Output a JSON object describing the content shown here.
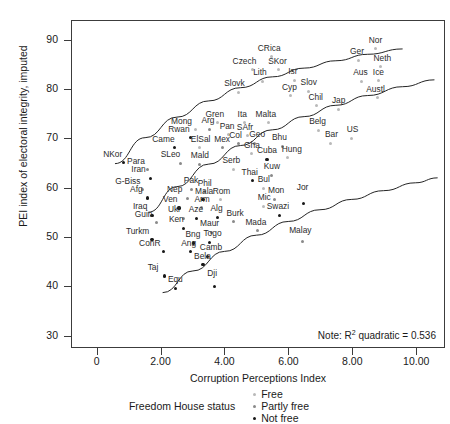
{
  "chart": {
    "type": "scatter",
    "title": "",
    "xlabel": "Corruption Perceptions Index",
    "ylabel": "PEI index of electoral integrity, imputed",
    "note": "Note: R",
    "note_sup": "2",
    "note_tail": " quadratic = 0.536",
    "xlim": [
      -0.8,
      10.9
    ],
    "ylim": [
      27.5,
      94.0
    ],
    "xticks": [
      "0",
      "2.00",
      "4.00",
      "6.00",
      "8.00",
      "10.00"
    ],
    "xtick_values": [
      0,
      2,
      4,
      6,
      8,
      10
    ],
    "yticks": [
      "30",
      "40",
      "50",
      "60",
      "70",
      "80",
      "90"
    ],
    "ytick_values": [
      30,
      40,
      50,
      60,
      70,
      80,
      90
    ],
    "grid": false,
    "legend_title": "Freedom House status",
    "legend": [
      {
        "label": "Free",
        "color": "#b9b9b9",
        "key": "free"
      },
      {
        "label": "Partly free",
        "color": "#8a8a8a",
        "key": "partly"
      },
      {
        "label": "Not free",
        "color": "#171717",
        "key": "notfree"
      }
    ]
  },
  "chart_data": {
    "type": "scatter",
    "title": "",
    "xlabel": "Corruption Perceptions Index",
    "ylabel": "PEI index of electoral integrity, imputed",
    "xlim": [
      -0.8,
      10.9
    ],
    "ylim": [
      27.5,
      94.0
    ],
    "annotation": "Note: R2 quadratic = 0.536",
    "r2_quadratic": 0.536,
    "legend_title": "Freedom House status",
    "series": [
      {
        "name": "Free",
        "color": "#b9b9b9"
      },
      {
        "name": "Partly free",
        "color": "#8a8a8a"
      },
      {
        "name": "Not free",
        "color": "#171717"
      }
    ],
    "fit_lines": [
      {
        "name": "upper-confidence-curve",
        "points": [
          [
            0.55,
            64.9
          ],
          [
            1.5,
            70.2
          ],
          [
            2.5,
            74.4
          ],
          [
            3.5,
            77.7
          ],
          [
            4.5,
            80.4
          ],
          [
            5.5,
            82.6
          ],
          [
            6.5,
            84.4
          ],
          [
            7.5,
            85.9
          ],
          [
            8.5,
            87.2
          ],
          [
            9.6,
            88.3
          ]
        ]
      },
      {
        "name": "quadratic-fit-curve",
        "points": [
          [
            1.6,
            55.0
          ],
          [
            2.5,
            60.2
          ],
          [
            3.5,
            64.8
          ],
          [
            4.5,
            68.6
          ],
          [
            5.5,
            71.8
          ],
          [
            6.5,
            74.5
          ],
          [
            7.5,
            76.8
          ],
          [
            8.5,
            78.8
          ],
          [
            9.6,
            80.6
          ],
          [
            10.6,
            82.0
          ]
        ]
      },
      {
        "name": "lower-confidence-curve",
        "points": [
          [
            2.05,
            38.6
          ],
          [
            3.0,
            43.0
          ],
          [
            4.0,
            47.0
          ],
          [
            5.0,
            50.3
          ],
          [
            6.0,
            53.1
          ],
          [
            7.0,
            55.5
          ],
          [
            8.0,
            57.6
          ],
          [
            9.0,
            59.4
          ],
          [
            10.0,
            61.0
          ],
          [
            10.7,
            62.0
          ]
        ]
      }
    ],
    "points": [
      {
        "label": "NKor",
        "x": 0.8,
        "y": 65.3,
        "group": "notfree",
        "lx": -20,
        "ly": -4
      },
      {
        "label": "Para",
        "x": 1.55,
        "y": 63.8,
        "group": "partly",
        "lx": -20,
        "ly": -4
      },
      {
        "label": "Iran",
        "x": 1.65,
        "y": 62.1,
        "group": "notfree",
        "lx": -19,
        "ly": -4
      },
      {
        "label": "G-Biss",
        "x": 1.4,
        "y": 59.8,
        "group": "partly",
        "lx": -27,
        "ly": -4
      },
      {
        "label": "Afg",
        "x": 1.55,
        "y": 58.1,
        "group": "notfree",
        "lx": -17,
        "ly": -4
      },
      {
        "label": "Iraq",
        "x": 1.7,
        "y": 54.6,
        "group": "notfree",
        "lx": -19,
        "ly": -4
      },
      {
        "label": "Guin",
        "x": 1.85,
        "y": 53.1,
        "group": "partly",
        "lx": -22,
        "ly": -4
      },
      {
        "label": "Turkm",
        "x": 1.7,
        "y": 49.7,
        "group": "notfree",
        "lx": -26,
        "ly": -4
      },
      {
        "label": "ConR",
        "x": 2.05,
        "y": 47.2,
        "group": "notfree",
        "lx": -24,
        "ly": -4
      },
      {
        "label": "Taj",
        "x": 2.1,
        "y": 42.3,
        "group": "notfree",
        "lx": -17,
        "ly": -4
      },
      {
        "label": "Equ",
        "x": 2.45,
        "y": 39.8,
        "group": "notfree",
        "lx": -8,
        "ly": -4
      },
      {
        "label": "Mong",
        "x": 3.05,
        "y": 72.0,
        "group": "free",
        "lx": -24,
        "ly": -4
      },
      {
        "label": "Arg",
        "x": 3.5,
        "y": 72.1,
        "group": "partly",
        "lx": -8,
        "ly": -4
      },
      {
        "label": "Rwan",
        "x": 2.9,
        "y": 70.3,
        "group": "notfree",
        "lx": -22,
        "ly": -4
      },
      {
        "label": "Came",
        "x": 2.4,
        "y": 68.3,
        "group": "notfree",
        "lx": -22,
        "ly": -4
      },
      {
        "label": "ElSal",
        "x": 3.2,
        "y": 68.3,
        "group": "free",
        "lx": -9,
        "ly": -4
      },
      {
        "label": "Mex",
        "x": 3.9,
        "y": 68.3,
        "group": "partly",
        "lx": -8,
        "ly": -4
      },
      {
        "label": "SLeo",
        "x": 2.6,
        "y": 65.2,
        "group": "partly",
        "lx": -20,
        "ly": -4
      },
      {
        "label": "Mald",
        "x": 3.2,
        "y": 65.0,
        "group": "partly",
        "lx": -9,
        "ly": -4
      },
      {
        "label": "Serb",
        "x": 4.25,
        "y": 63.9,
        "group": "free",
        "lx": -11,
        "ly": -4
      },
      {
        "label": "Gren",
        "x": 3.75,
        "y": 73.4,
        "group": "free",
        "lx": -12,
        "ly": -4
      },
      {
        "label": "Pan",
        "x": 4.1,
        "y": 70.9,
        "group": "free",
        "lx": -9,
        "ly": -4
      },
      {
        "label": "Ita",
        "x": 4.6,
        "y": 73.4,
        "group": "free",
        "lx": -7,
        "ly": -4
      },
      {
        "label": "SAfr",
        "x": 4.7,
        "y": 70.7,
        "group": "free",
        "lx": -11,
        "ly": -4
      },
      {
        "label": "Col",
        "x": 4.4,
        "y": 69.1,
        "group": "partly",
        "lx": -9,
        "ly": -4
      },
      {
        "label": "Geo",
        "x": 4.9,
        "y": 69.2,
        "group": "partly",
        "lx": -5,
        "ly": -4
      },
      {
        "label": "Gha",
        "x": 4.8,
        "y": 67.1,
        "group": "free",
        "lx": -7,
        "ly": -4
      },
      {
        "label": "Malta",
        "x": 5.35,
        "y": 73.4,
        "group": "free",
        "lx": -13,
        "ly": -4
      },
      {
        "label": "Bhu",
        "x": 5.8,
        "y": 68.6,
        "group": "partly",
        "lx": -11,
        "ly": -4
      },
      {
        "label": "Cuba",
        "x": 5.3,
        "y": 66.0,
        "group": "notfree",
        "lx": -10,
        "ly": -4
      },
      {
        "label": "Hung",
        "x": 5.95,
        "y": 66.3,
        "group": "free",
        "lx": -6,
        "ly": -4
      },
      {
        "label": "Kuw",
        "x": 5.45,
        "y": 62.7,
        "group": "partly",
        "lx": -8,
        "ly": -4
      },
      {
        "label": "Thai",
        "x": 4.85,
        "y": 61.6,
        "group": "notfree",
        "lx": -11,
        "ly": -4
      },
      {
        "label": "Bul",
        "x": 5.2,
        "y": 60.1,
        "group": "free",
        "lx": -6,
        "ly": -4
      },
      {
        "label": "Mon",
        "x": 5.55,
        "y": 57.9,
        "group": "partly",
        "lx": -7,
        "ly": -4
      },
      {
        "label": "Jor",
        "x": 6.45,
        "y": 57.0,
        "group": "notfree",
        "lx": -7,
        "ly": -11
      },
      {
        "label": "Mic",
        "x": 5.2,
        "y": 56.4,
        "group": "free",
        "lx": -6,
        "ly": -4
      },
      {
        "label": "Swazi",
        "x": 5.7,
        "y": 54.6,
        "group": "notfree",
        "lx": -13,
        "ly": -4
      },
      {
        "label": "Mada",
        "x": 5.0,
        "y": 51.5,
        "group": "partly",
        "lx": -12,
        "ly": -4
      },
      {
        "label": "Malay",
        "x": 6.4,
        "y": 49.3,
        "group": "partly",
        "lx": -13,
        "ly": -6
      },
      {
        "label": "Pak",
        "x": 2.95,
        "y": 59.9,
        "group": "partly",
        "lx": -8,
        "ly": -4
      },
      {
        "label": "Phil",
        "x": 3.35,
        "y": 59.4,
        "group": "partly",
        "lx": -7,
        "ly": -4
      },
      {
        "label": "Nep",
        "x": 2.8,
        "y": 58.1,
        "group": "partly",
        "lx": -20,
        "ly": -4
      },
      {
        "label": "Mala",
        "x": 3.3,
        "y": 57.8,
        "group": "notfree",
        "lx": -8,
        "ly": -4
      },
      {
        "label": "Rom",
        "x": 3.85,
        "y": 57.8,
        "group": "free",
        "lx": -8,
        "ly": -4
      },
      {
        "label": "Ven",
        "x": 2.55,
        "y": 56.1,
        "group": "notfree",
        "lx": -16,
        "ly": -4
      },
      {
        "label": "Arm",
        "x": 3.25,
        "y": 56.1,
        "group": "partly",
        "lx": -7,
        "ly": -4
      },
      {
        "label": "Ukr",
        "x": 2.7,
        "y": 54.0,
        "group": "partly",
        "lx": -16,
        "ly": -4
      },
      {
        "label": "Aze",
        "x": 3.1,
        "y": 54.0,
        "group": "notfree",
        "lx": -8,
        "ly": -4
      },
      {
        "label": "Alg",
        "x": 3.75,
        "y": 54.2,
        "group": "notfree",
        "lx": -7,
        "ly": -4
      },
      {
        "label": "Burk",
        "x": 4.25,
        "y": 53.3,
        "group": "partly",
        "lx": -7,
        "ly": -4
      },
      {
        "label": "Ken",
        "x": 2.7,
        "y": 52.0,
        "group": "notfree",
        "lx": -15,
        "ly": -4
      },
      {
        "label": "Maur",
        "x": 3.55,
        "y": 51.2,
        "group": "partly",
        "lx": -11,
        "ly": -4
      },
      {
        "label": "Bng",
        "x": 3.0,
        "y": 49.0,
        "group": "notfree",
        "lx": -8,
        "ly": -4
      },
      {
        "label": "Togo",
        "x": 3.5,
        "y": 49.1,
        "group": "notfree",
        "lx": -6,
        "ly": -4
      },
      {
        "label": "Ang",
        "x": 2.9,
        "y": 47.2,
        "group": "notfree",
        "lx": -9,
        "ly": -4
      },
      {
        "label": "Camb",
        "x": 3.45,
        "y": 46.3,
        "group": "notfree",
        "lx": -8,
        "ly": -4
      },
      {
        "label": "Bela",
        "x": 3.3,
        "y": 44.6,
        "group": "notfree",
        "lx": -9,
        "ly": -4
      },
      {
        "label": "Dji",
        "x": 3.65,
        "y": 40.1,
        "group": "notfree",
        "lx": -7,
        "ly": -9
      },
      {
        "label": "CRica",
        "x": 5.45,
        "y": 86.8,
        "group": "free",
        "lx": -14,
        "ly": -4
      },
      {
        "label": "Czech",
        "x": 4.85,
        "y": 84.1,
        "group": "free",
        "lx": -20,
        "ly": -4
      },
      {
        "label": "SKor",
        "x": 5.65,
        "y": 84.1,
        "group": "free",
        "lx": -10,
        "ly": -4
      },
      {
        "label": "Lith",
        "x": 5.15,
        "y": 81.8,
        "group": "free",
        "lx": -9,
        "ly": -4
      },
      {
        "label": "Isr",
        "x": 6.15,
        "y": 82.0,
        "group": "free",
        "lx": -6,
        "ly": -4
      },
      {
        "label": "Slovk",
        "x": 4.4,
        "y": 79.6,
        "group": "free",
        "lx": -14,
        "ly": -4
      },
      {
        "label": "Cyp",
        "x": 6.05,
        "y": 78.8,
        "group": "free",
        "lx": -9,
        "ly": -4
      },
      {
        "label": "Slov",
        "x": 6.6,
        "y": 79.8,
        "group": "free",
        "lx": -8,
        "ly": -4
      },
      {
        "label": "Chil",
        "x": 6.85,
        "y": 76.8,
        "group": "free",
        "lx": -8,
        "ly": -4
      },
      {
        "label": "Jap",
        "x": 7.55,
        "y": 76.1,
        "group": "free",
        "lx": -7,
        "ly": -4
      },
      {
        "label": "Belg",
        "x": 6.9,
        "y": 71.8,
        "group": "free",
        "lx": -9,
        "ly": -4
      },
      {
        "label": "Bar",
        "x": 7.3,
        "y": 69.2,
        "group": "free",
        "lx": -6,
        "ly": -4
      },
      {
        "label": "US",
        "x": 7.95,
        "y": 70.2,
        "group": "free",
        "lx": -5,
        "ly": -4
      },
      {
        "label": "Ger",
        "x": 8.15,
        "y": 86.0,
        "group": "free",
        "lx": -8,
        "ly": -4
      },
      {
        "label": "Nor",
        "x": 8.7,
        "y": 88.4,
        "group": "free",
        "lx": -7,
        "ly": -4
      },
      {
        "label": "Neth",
        "x": 8.85,
        "y": 84.7,
        "group": "free",
        "lx": -7,
        "ly": -4
      },
      {
        "label": "Aus",
        "x": 8.25,
        "y": 81.8,
        "group": "free",
        "lx": -8,
        "ly": -4
      },
      {
        "label": "Ice",
        "x": 8.8,
        "y": 81.9,
        "group": "free",
        "lx": -6,
        "ly": -4
      },
      {
        "label": "Austl",
        "x": 8.75,
        "y": 78.4,
        "group": "free",
        "lx": -11,
        "ly": -4
      }
    ]
  }
}
